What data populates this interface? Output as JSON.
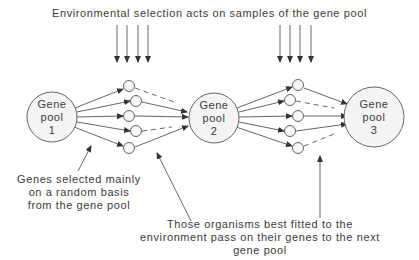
{
  "title": "Environmental selection acts on samples of the gene pool",
  "pools": [
    {
      "label": [
        "Gene",
        "pool",
        "1"
      ]
    },
    {
      "label": [
        "Gene",
        "pool",
        "2"
      ]
    },
    {
      "label": [
        "Gene",
        "pool",
        "3"
      ]
    }
  ],
  "annotations": {
    "random": [
      "Genes selected mainly",
      "on a random basis",
      "from the gene pool"
    ],
    "fitted": [
      "Those organisms best fitted to the",
      "environment pass on their genes to the next",
      "gene pool"
    ]
  },
  "colors": {
    "line": "#555555",
    "circle_fill": "#f4f4f4",
    "text": "#3a3a3a"
  }
}
